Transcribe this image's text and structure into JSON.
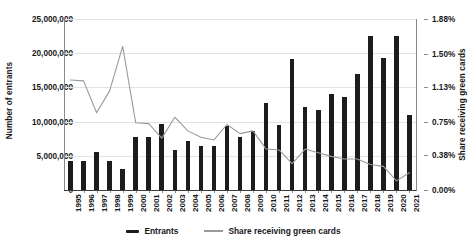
{
  "chart_data": {
    "type": "bar",
    "title": "",
    "subtitle": "",
    "xlabel": "",
    "ylabel": "Number of entrants",
    "y2label": "Share receiving green cards",
    "grid": true,
    "legend_position": "bottom",
    "ylim": [
      0,
      25000000
    ],
    "y2lim": [
      0,
      0.0188
    ],
    "ytick_labels": [
      "25,000,000",
      "20,000,000",
      "15,000,000",
      "10,000,000",
      "5,000,000",
      "0"
    ],
    "ytick_values": [
      25000000,
      20000000,
      15000000,
      10000000,
      5000000,
      0
    ],
    "y2tick_labels": [
      "1.88%",
      "1.50%",
      "1.13%",
      "0.75%",
      "0.38%",
      "0.00%"
    ],
    "y2tick_values": [
      1.88,
      1.5,
      1.13,
      0.75,
      0.38,
      0.0
    ],
    "categories": [
      "1995",
      "1996",
      "1997",
      "1998",
      "1999",
      "2000",
      "2001",
      "2002",
      "2003",
      "2004",
      "2005",
      "2006",
      "2007",
      "2008",
      "2009",
      "2010",
      "2011",
      "2012",
      "2013",
      "2014",
      "2015",
      "2016",
      "2017",
      "2018",
      "2019",
      "2020",
      "2021"
    ],
    "series": [
      {
        "name": "Entrants",
        "type": "bar",
        "axis": "left",
        "color": "#1c1c1c",
        "unit": "entrants",
        "values": [
          4200000,
          4200000,
          5600000,
          4300000,
          3100000,
          7700000,
          7700000,
          9600000,
          5900000,
          7200000,
          6400000,
          6500000,
          9300000,
          7700000,
          8600000,
          12700000,
          9500000,
          19200000,
          12200000,
          11700000,
          14000000,
          13600000,
          16900000,
          22500000,
          19300000,
          22500000,
          11000000
        ]
      },
      {
        "name": "Share receiving green cards",
        "type": "line",
        "axis": "right",
        "color": "#9a9a9a",
        "unit": "percent",
        "values": [
          1.21,
          1.2,
          0.85,
          1.09,
          1.58,
          0.74,
          0.73,
          0.57,
          0.8,
          0.65,
          0.58,
          0.55,
          0.72,
          0.62,
          0.65,
          0.45,
          0.44,
          0.29,
          0.45,
          0.41,
          0.37,
          0.34,
          0.34,
          0.28,
          0.26,
          0.1,
          0.19
        ]
      }
    ]
  },
  "legend": {
    "items": [
      {
        "label": "Entrants",
        "marker": "bar-swatch"
      },
      {
        "label": "Share receiving green cards",
        "marker": "line-swatch"
      }
    ]
  }
}
